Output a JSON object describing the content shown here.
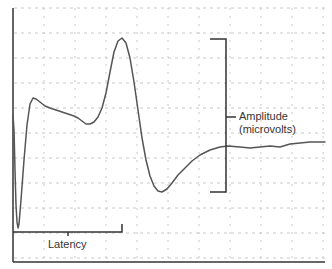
{
  "chart_data": {
    "type": "line",
    "title": "",
    "xlabel": "",
    "ylabel": "",
    "grid": true,
    "legend": "none",
    "series": [
      {
        "name": "waveform",
        "points_px": [
          [
            13,
            116
          ],
          [
            14,
            130
          ],
          [
            15,
            170
          ],
          [
            16,
            205
          ],
          [
            17,
            222
          ],
          [
            18,
            228
          ],
          [
            19,
            224
          ],
          [
            21,
            200
          ],
          [
            24,
            160
          ],
          [
            27,
            125
          ],
          [
            30,
            104
          ],
          [
            33,
            98
          ],
          [
            36,
            99
          ],
          [
            40,
            102
          ],
          [
            45,
            106
          ],
          [
            50,
            108
          ],
          [
            56,
            110
          ],
          [
            62,
            112
          ],
          [
            68,
            114
          ],
          [
            74,
            116
          ],
          [
            78,
            118
          ],
          [
            82,
            121
          ],
          [
            86,
            124
          ],
          [
            90,
            124
          ],
          [
            94,
            122
          ],
          [
            98,
            117
          ],
          [
            102,
            108
          ],
          [
            106,
            93
          ],
          [
            110,
            72
          ],
          [
            114,
            52
          ],
          [
            118,
            41
          ],
          [
            122,
            38
          ],
          [
            126,
            43
          ],
          [
            130,
            58
          ],
          [
            134,
            82
          ],
          [
            138,
            110
          ],
          [
            142,
            138
          ],
          [
            146,
            160
          ],
          [
            150,
            176
          ],
          [
            154,
            186
          ],
          [
            158,
            191
          ],
          [
            162,
            192
          ],
          [
            167,
            189
          ],
          [
            172,
            183
          ],
          [
            178,
            175
          ],
          [
            185,
            168
          ],
          [
            192,
            161
          ],
          [
            200,
            155
          ],
          [
            210,
            150
          ],
          [
            220,
            147
          ],
          [
            228,
            146
          ],
          [
            240,
            147
          ],
          [
            250,
            148
          ],
          [
            260,
            147
          ],
          [
            270,
            146
          ],
          [
            280,
            147
          ],
          [
            290,
            144
          ],
          [
            300,
            143
          ],
          [
            310,
            142
          ],
          [
            325,
            142
          ]
        ]
      }
    ],
    "annotations": [
      {
        "text": "Amplitude",
        "kind": "vertical-bracket"
      },
      {
        "text": "(microvolts)",
        "kind": "vertical-bracket-sub"
      },
      {
        "text": "Latency",
        "kind": "horizontal-bracket"
      }
    ],
    "axes": {
      "x_ticks": [],
      "y_ticks": []
    }
  },
  "labels": {
    "amplitude": "Amplitude",
    "amplitude_unit": "(microvolts)",
    "latency": "Latency"
  },
  "colors": {
    "line": "#555555",
    "axis": "#333333",
    "grid": "#c8c8c8",
    "text": "#333333"
  }
}
